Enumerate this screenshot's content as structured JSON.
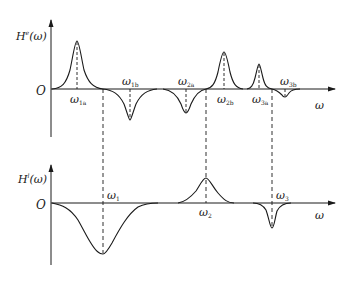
{
  "diagram": {
    "colors": {
      "line": "#1a1a1a",
      "background": "#ffffff"
    },
    "upper_plot": {
      "y_label": {
        "base": "H",
        "sup": "e",
        "arg": "(ω)"
      },
      "origin": "O",
      "x_label": "ω",
      "markers": [
        {
          "id": "w1a",
          "base": "ω",
          "sub": "1a",
          "type": "peak",
          "position": "below"
        },
        {
          "id": "w1b",
          "base": "ω",
          "sub": "1b",
          "type": "dip",
          "position": "above"
        },
        {
          "id": "w2a",
          "base": "ω",
          "sub": "2a",
          "type": "dip",
          "position": "above"
        },
        {
          "id": "w2b",
          "base": "ω",
          "sub": "2b",
          "type": "peak",
          "position": "below"
        },
        {
          "id": "w3a",
          "base": "ω",
          "sub": "3a",
          "type": "peak",
          "position": "below"
        },
        {
          "id": "w3b",
          "base": "ω",
          "sub": "3b",
          "type": "dip",
          "position": "above"
        }
      ]
    },
    "lower_plot": {
      "y_label": {
        "base": "H",
        "sup": "l",
        "arg": "(ω)"
      },
      "origin": "O",
      "x_label": "ω",
      "markers": [
        {
          "id": "w1",
          "base": "ω",
          "sub": "1",
          "type": "dip",
          "position": "above"
        },
        {
          "id": "w2",
          "base": "ω",
          "sub": "2",
          "type": "peak",
          "position": "below"
        },
        {
          "id": "w3",
          "base": "ω",
          "sub": "3",
          "type": "dip",
          "position": "above"
        }
      ]
    }
  }
}
